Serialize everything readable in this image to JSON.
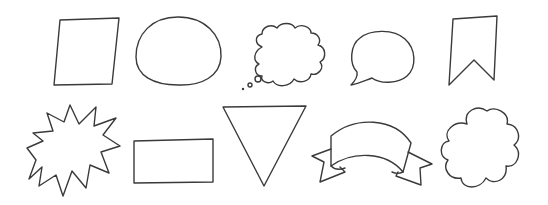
{
  "canvas": {
    "width": 548,
    "height": 205,
    "background": "#ffffff",
    "stroke_color": "#3a3a3a",
    "title": "Hand-drawn shapes"
  },
  "shapes": [
    {
      "name": "square-frame",
      "label": "Square frame",
      "row": 1
    },
    {
      "name": "oval-frame",
      "label": "Oval frame",
      "row": 1
    },
    {
      "name": "thought-bubble",
      "label": "Thought bubble",
      "row": 1
    },
    {
      "name": "speech-bubble",
      "label": "Speech bubble",
      "row": 1
    },
    {
      "name": "bookmark-banner",
      "label": "Bookmark banner",
      "row": 1
    },
    {
      "name": "starburst",
      "label": "Starburst",
      "row": 2
    },
    {
      "name": "rectangle-frame",
      "label": "Rectangle frame",
      "row": 2
    },
    {
      "name": "inverted-triangle",
      "label": "Inverted triangle",
      "row": 2
    },
    {
      "name": "ribbon-banner",
      "label": "Ribbon banner",
      "row": 2
    },
    {
      "name": "cloud-flower",
      "label": "Cloud flower",
      "row": 2
    }
  ]
}
